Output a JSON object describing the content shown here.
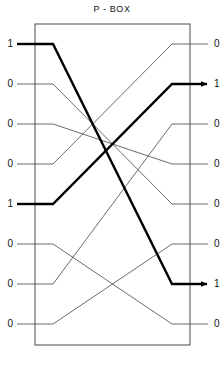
{
  "title": "P - BOX",
  "colors": {
    "box": "#4a4a4a",
    "wire_thin": "#5a5a5a",
    "wire_thick": "#000000",
    "text": "#111111",
    "background": "#ffffff"
  },
  "box": {
    "x": 35,
    "y": 24,
    "width": 155,
    "height": 321
  },
  "geometry": {
    "row_y": [
      44,
      84,
      124,
      164,
      204,
      244,
      284,
      324
    ],
    "stub_len": 18,
    "left_edge": 35,
    "right_edge": 190
  },
  "inputs": [
    {
      "index": 1,
      "label": "1",
      "y": 44,
      "active": true
    },
    {
      "index": 2,
      "label": "0",
      "y": 84,
      "active": false
    },
    {
      "index": 3,
      "label": "0",
      "y": 124,
      "active": false
    },
    {
      "index": 4,
      "label": "0",
      "y": 164,
      "active": false
    },
    {
      "index": 5,
      "label": "1",
      "y": 204,
      "active": true
    },
    {
      "index": 6,
      "label": "0",
      "y": 244,
      "active": false
    },
    {
      "index": 7,
      "label": "0",
      "y": 284,
      "active": false
    },
    {
      "index": 8,
      "label": "0",
      "y": 324,
      "active": false
    }
  ],
  "outputs": [
    {
      "index": 1,
      "label": "0",
      "y": 44,
      "active": false,
      "arrow": false
    },
    {
      "index": 2,
      "label": "1",
      "y": 84,
      "active": true,
      "arrow": true
    },
    {
      "index": 3,
      "label": "0",
      "y": 124,
      "active": false,
      "arrow": false
    },
    {
      "index": 4,
      "label": "0",
      "y": 164,
      "active": false,
      "arrow": false
    },
    {
      "index": 5,
      "label": "0",
      "y": 204,
      "active": false,
      "arrow": false
    },
    {
      "index": 6,
      "label": "0",
      "y": 244,
      "active": false,
      "arrow": false
    },
    {
      "index": 7,
      "label": "1",
      "y": 284,
      "active": true,
      "arrow": true
    },
    {
      "index": 8,
      "label": "0",
      "y": 324,
      "active": false,
      "arrow": false
    }
  ],
  "wires": [
    {
      "from": 1,
      "to": 7,
      "active": true
    },
    {
      "from": 2,
      "to": 5,
      "active": false
    },
    {
      "from": 3,
      "to": 4,
      "active": false
    },
    {
      "from": 4,
      "to": 1,
      "active": false
    },
    {
      "from": 5,
      "to": 2,
      "active": true
    },
    {
      "from": 6,
      "to": 8,
      "active": false
    },
    {
      "from": 7,
      "to": 3,
      "active": false
    },
    {
      "from": 8,
      "to": 6,
      "active": false
    }
  ],
  "permutation": [
    7,
    5,
    4,
    1,
    2,
    8,
    3,
    6
  ]
}
